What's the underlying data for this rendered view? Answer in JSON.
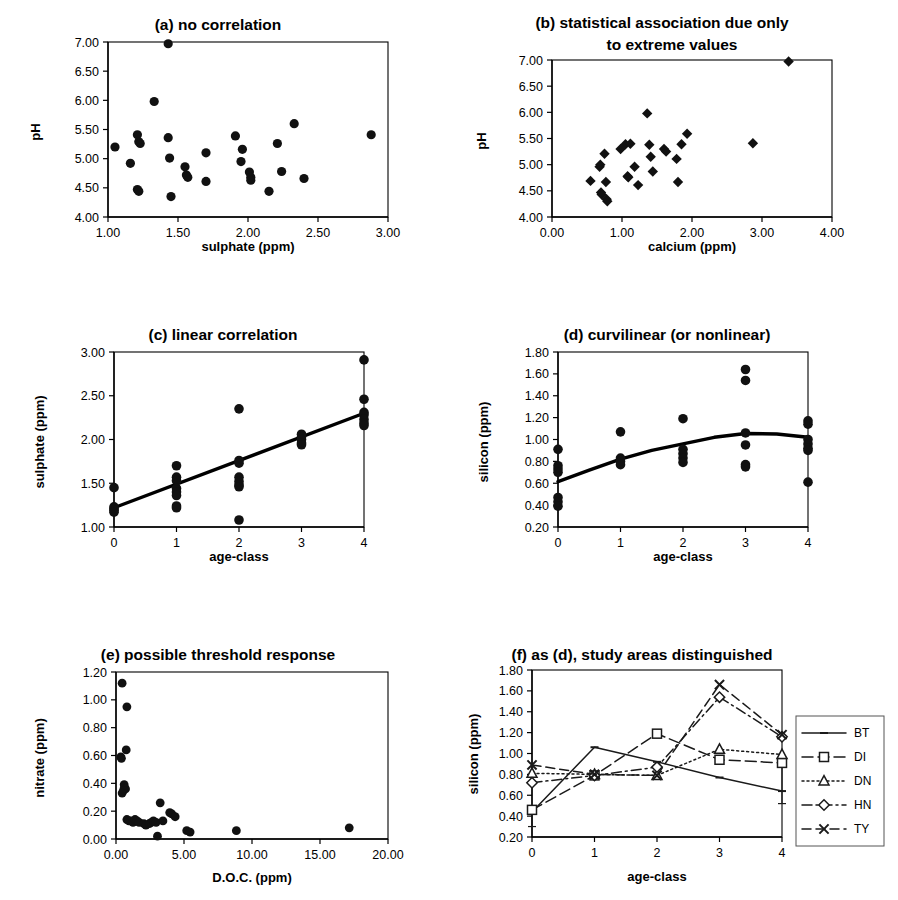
{
  "figure": {
    "panel_count": 6,
    "background": "#ffffff",
    "ink": "#000000"
  },
  "chart_data": [
    {
      "id": "a",
      "type": "scatter",
      "title": "(a) no correlation",
      "title_prefix": "(a)",
      "title_rest": " no correlation",
      "xlabel": "sulphate (ppm)",
      "ylabel": "pH",
      "xlim": [
        1.0,
        3.0
      ],
      "ylim": [
        4.0,
        7.0
      ],
      "xticks": [
        "1.00",
        "1.50",
        "2.00",
        "2.50",
        "3.00"
      ],
      "xtick_values": [
        1.0,
        1.5,
        2.0,
        2.5,
        3.0
      ],
      "yticks": [
        "4.00",
        "4.50",
        "5.00",
        "5.50",
        "6.00",
        "6.50",
        "7.00"
      ],
      "ytick_values": [
        4.0,
        4.5,
        5.0,
        5.5,
        6.0,
        6.5,
        7.0
      ],
      "grid": false,
      "marker": "filled-circle",
      "points": [
        [
          1.05,
          5.2
        ],
        [
          1.16,
          4.92
        ],
        [
          1.21,
          5.41
        ],
        [
          1.22,
          5.29
        ],
        [
          1.23,
          5.26
        ],
        [
          1.21,
          4.47
        ],
        [
          1.22,
          4.44
        ],
        [
          1.33,
          5.98
        ],
        [
          1.43,
          6.97
        ],
        [
          1.43,
          5.36
        ],
        [
          1.44,
          5.01
        ],
        [
          1.45,
          4.35
        ],
        [
          1.55,
          4.86
        ],
        [
          1.56,
          4.72
        ],
        [
          1.57,
          4.68
        ],
        [
          1.7,
          5.1
        ],
        [
          1.7,
          4.61
        ],
        [
          1.91,
          5.39
        ],
        [
          1.96,
          5.16
        ],
        [
          1.95,
          4.95
        ],
        [
          2.01,
          4.77
        ],
        [
          2.02,
          4.68
        ],
        [
          2.02,
          4.63
        ],
        [
          2.15,
          4.44
        ],
        [
          2.21,
          5.26
        ],
        [
          2.24,
          4.78
        ],
        [
          2.33,
          5.6
        ],
        [
          2.4,
          4.66
        ],
        [
          2.88,
          5.41
        ]
      ]
    },
    {
      "id": "b",
      "type": "scatter",
      "title": "(b) statistical association due only to extreme values",
      "title_line1": "(b) statistical association due only",
      "title_line2": "to extreme values",
      "title_prefix": "(b)",
      "title_rest": " statistical association due only",
      "xlabel": "calcium (ppm)",
      "ylabel": "pH",
      "xlim": [
        0.0,
        4.0
      ],
      "ylim": [
        4.0,
        7.0
      ],
      "xticks": [
        "0.00",
        "1.00",
        "2.00",
        "3.00",
        "4.00"
      ],
      "xtick_values": [
        0.0,
        1.0,
        2.0,
        3.0,
        4.0
      ],
      "yticks": [
        "4.00",
        "4.50",
        "5.00",
        "5.50",
        "6.00",
        "6.50",
        "7.00"
      ],
      "ytick_values": [
        4.0,
        4.5,
        5.0,
        5.5,
        6.0,
        6.5,
        7.0
      ],
      "grid": false,
      "marker": "filled-diamond",
      "points": [
        [
          0.55,
          4.69
        ],
        [
          0.68,
          4.96
        ],
        [
          0.69,
          5.0
        ],
        [
          0.7,
          4.47
        ],
        [
          0.71,
          4.43
        ],
        [
          0.75,
          5.21
        ],
        [
          0.77,
          4.67
        ],
        [
          0.78,
          4.34
        ],
        [
          0.79,
          4.3
        ],
        [
          0.98,
          5.3
        ],
        [
          1.05,
          5.39
        ],
        [
          1.08,
          4.78
        ],
        [
          1.09,
          4.76
        ],
        [
          1.12,
          5.4
        ],
        [
          1.18,
          4.96
        ],
        [
          1.23,
          4.61
        ],
        [
          1.36,
          5.98
        ],
        [
          1.39,
          5.38
        ],
        [
          1.41,
          5.15
        ],
        [
          1.44,
          4.87
        ],
        [
          1.6,
          5.3
        ],
        [
          1.63,
          5.25
        ],
        [
          1.78,
          5.11
        ],
        [
          1.8,
          4.67
        ],
        [
          1.85,
          5.39
        ],
        [
          1.93,
          5.59
        ],
        [
          2.87,
          5.41
        ],
        [
          3.38,
          6.97
        ]
      ]
    },
    {
      "id": "c",
      "type": "scatter",
      "title": "(c) linear correlation",
      "title_prefix": "(c)",
      "title_rest": " linear correlation",
      "xlabel": "age-class",
      "ylabel": "sulphate (ppm)",
      "xlim": [
        0,
        4
      ],
      "ylim": [
        1.0,
        3.0
      ],
      "xticks": [
        "0",
        "1",
        "2",
        "3",
        "4"
      ],
      "xtick_values": [
        0,
        1,
        2,
        3,
        4
      ],
      "yticks": [
        "1.00",
        "1.50",
        "2.00",
        "2.50",
        "3.00"
      ],
      "ytick_values": [
        1.0,
        1.5,
        2.0,
        2.5,
        3.0
      ],
      "grid": false,
      "marker": "filled-circle",
      "points": [
        [
          0,
          1.45
        ],
        [
          0,
          1.23
        ],
        [
          0,
          1.21
        ],
        [
          0,
          1.19
        ],
        [
          0,
          1.17
        ],
        [
          1,
          1.7
        ],
        [
          1,
          1.57
        ],
        [
          1,
          1.53
        ],
        [
          1,
          1.44
        ],
        [
          1,
          1.4
        ],
        [
          1,
          1.36
        ],
        [
          1,
          1.24
        ],
        [
          1,
          1.22
        ],
        [
          2,
          2.35
        ],
        [
          2,
          1.76
        ],
        [
          2,
          1.73
        ],
        [
          2,
          1.57
        ],
        [
          2,
          1.52
        ],
        [
          2,
          1.48
        ],
        [
          2,
          1.46
        ],
        [
          2,
          1.08
        ],
        [
          3,
          2.06
        ],
        [
          3,
          2.03
        ],
        [
          3,
          2.0
        ],
        [
          3,
          1.96
        ],
        [
          3,
          1.94
        ],
        [
          4,
          2.91
        ],
        [
          4,
          2.46
        ],
        [
          4,
          2.31
        ],
        [
          4,
          2.28
        ],
        [
          4,
          2.23
        ],
        [
          4,
          2.19
        ],
        [
          4,
          2.16
        ]
      ],
      "fit": {
        "kind": "linear",
        "label": "linear trend line",
        "points": [
          [
            0,
            1.22
          ],
          [
            4,
            2.3
          ]
        ]
      }
    },
    {
      "id": "d",
      "type": "scatter",
      "title": "(d) curvilinear (or nonlinear)",
      "title_prefix": "(d)",
      "title_rest": " curvilinear (or nonlinear)",
      "xlabel": "age-class",
      "ylabel": "silicon (ppm)",
      "xlim": [
        0,
        4
      ],
      "ylim": [
        0.2,
        1.8
      ],
      "xticks": [
        "0",
        "1",
        "2",
        "3",
        "4"
      ],
      "xtick_values": [
        0,
        1,
        2,
        3,
        4
      ],
      "yticks": [
        "0.20",
        "0.40",
        "0.60",
        "0.80",
        "1.00",
        "1.20",
        "1.40",
        "1.60",
        "1.80"
      ],
      "ytick_values": [
        0.2,
        0.4,
        0.6,
        0.8,
        1.0,
        1.2,
        1.4,
        1.6,
        1.8
      ],
      "grid": false,
      "marker": "filled-circle",
      "points": [
        [
          0,
          0.91
        ],
        [
          0,
          0.76
        ],
        [
          0,
          0.73
        ],
        [
          0,
          0.7
        ],
        [
          0,
          0.47
        ],
        [
          0,
          0.43
        ],
        [
          0,
          0.39
        ],
        [
          1,
          1.07
        ],
        [
          1,
          0.83
        ],
        [
          1,
          0.8
        ],
        [
          1,
          0.77
        ],
        [
          2,
          1.19
        ],
        [
          2,
          0.91
        ],
        [
          2,
          0.87
        ],
        [
          2,
          0.83
        ],
        [
          2,
          0.79
        ],
        [
          3,
          1.64
        ],
        [
          3,
          1.54
        ],
        [
          3,
          1.06
        ],
        [
          3,
          0.95
        ],
        [
          3,
          0.77
        ],
        [
          3,
          0.75
        ],
        [
          4,
          1.17
        ],
        [
          4,
          1.14
        ],
        [
          4,
          1.0
        ],
        [
          4,
          0.96
        ],
        [
          4,
          0.92
        ],
        [
          4,
          0.9
        ],
        [
          4,
          0.61
        ]
      ],
      "fit": {
        "kind": "quadratic",
        "label": "curvilinear trend line",
        "points": [
          [
            0,
            0.615
          ],
          [
            0.5,
            0.72
          ],
          [
            1.0,
            0.82
          ],
          [
            1.5,
            0.9
          ],
          [
            2.0,
            0.96
          ],
          [
            2.5,
            1.02
          ],
          [
            3.0,
            1.055
          ],
          [
            3.5,
            1.05
          ],
          [
            4.0,
            1.02
          ]
        ]
      }
    },
    {
      "id": "e",
      "type": "scatter",
      "title": "(e) possible threshold response",
      "title_prefix": "(e)",
      "title_rest": " possible threshold response",
      "xlabel": "D.O.C. (ppm)",
      "ylabel": "nitrate (ppm)",
      "xlim": [
        0.0,
        20.0
      ],
      "ylim": [
        0.0,
        1.2
      ],
      "xticks": [
        "0.00",
        "5.00",
        "10.00",
        "15.00",
        "20.00"
      ],
      "xtick_values": [
        0.0,
        5.0,
        10.0,
        15.0,
        20.0
      ],
      "yticks": [
        "0.00",
        "0.20",
        "0.40",
        "0.60",
        "0.80",
        "1.00",
        "1.20"
      ],
      "ytick_values": [
        0.0,
        0.2,
        0.4,
        0.6,
        0.8,
        1.0,
        1.2
      ],
      "grid": false,
      "marker": "filled-circle",
      "points": [
        [
          0.45,
          1.12
        ],
        [
          0.8,
          0.95
        ],
        [
          0.75,
          0.64
        ],
        [
          0.35,
          0.59
        ],
        [
          0.4,
          0.58
        ],
        [
          0.6,
          0.39
        ],
        [
          0.62,
          0.37
        ],
        [
          0.7,
          0.36
        ],
        [
          0.55,
          0.35
        ],
        [
          0.45,
          0.33
        ],
        [
          0.8,
          0.14
        ],
        [
          0.95,
          0.13
        ],
        [
          1.1,
          0.13
        ],
        [
          1.25,
          0.12
        ],
        [
          1.4,
          0.14
        ],
        [
          1.55,
          0.13
        ],
        [
          1.7,
          0.12
        ],
        [
          2.05,
          0.11
        ],
        [
          2.2,
          0.1
        ],
        [
          2.45,
          0.11
        ],
        [
          2.6,
          0.12
        ],
        [
          2.75,
          0.13
        ],
        [
          2.95,
          0.12
        ],
        [
          3.05,
          0.02
        ],
        [
          3.25,
          0.26
        ],
        [
          3.45,
          0.13
        ],
        [
          3.95,
          0.19
        ],
        [
          4.1,
          0.18
        ],
        [
          4.35,
          0.16
        ],
        [
          5.2,
          0.06
        ],
        [
          5.45,
          0.05
        ],
        [
          8.85,
          0.06
        ],
        [
          17.15,
          0.08
        ]
      ]
    },
    {
      "id": "f",
      "type": "line",
      "title": "(f) as (d), study areas distinguished",
      "title_prefix": "(f)",
      "title_rest": " as (d), study areas distinguished",
      "xlabel": "age-class",
      "ylabel": "silicon (ppm)",
      "xlim": [
        0,
        4
      ],
      "ylim": [
        0.2,
        1.8
      ],
      "x": [
        0,
        1,
        2,
        3,
        4
      ],
      "xticks": [
        "0",
        "1",
        "2",
        "3",
        "4"
      ],
      "yticks": [
        "0.20",
        "0.40",
        "0.60",
        "0.80",
        "1.00",
        "1.20",
        "1.40",
        "1.60",
        "1.80"
      ],
      "ytick_values": [
        0.2,
        0.4,
        0.6,
        0.8,
        1.0,
        1.2,
        1.4,
        1.6,
        1.8
      ],
      "grid": false,
      "legend_position": "right",
      "series": [
        {
          "name": "BT",
          "marker": "dash",
          "dash": "none",
          "values": [
            0.44,
            1.06,
            0.92,
            0.77,
            0.64
          ]
        },
        {
          "name": "DI",
          "marker": "square",
          "dash": "long",
          "values": [
            0.46,
            0.79,
            1.19,
            0.94,
            0.91
          ]
        },
        {
          "name": "DN",
          "marker": "triangle",
          "dash": "dotted",
          "values": [
            0.81,
            0.8,
            0.79,
            1.04,
            0.99
          ]
        },
        {
          "name": "HN",
          "marker": "diamond",
          "dash": "dashdot",
          "values": [
            0.72,
            0.79,
            0.87,
            1.54,
            1.16
          ]
        },
        {
          "name": "TY",
          "marker": "cross",
          "dash": "dashed",
          "values": [
            0.89,
            0.8,
            0.79,
            1.66,
            1.18
          ]
        }
      ]
    }
  ]
}
